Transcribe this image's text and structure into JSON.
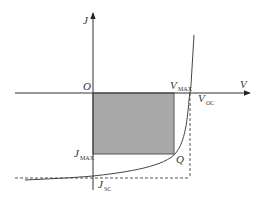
{
  "diagram": {
    "type": "solar-cell-iv-curve",
    "colors": {
      "axis": "#333333",
      "curve": "#444444",
      "rect_fill": "#a9a9a9",
      "rect_stroke": "#555555",
      "dashed": "#555555",
      "background": "#ffffff"
    },
    "axes": {
      "y_label": "J",
      "x_label": "V",
      "origin_label": "O"
    },
    "labels": {
      "vmax_main": "V",
      "vmax_sub": "MAX",
      "voc_main": "V",
      "voc_sub": "OC",
      "jmax_main": "J",
      "jmax_sub": "MAX",
      "jsc_main": "J",
      "jsc_sub": "SC",
      "q_point": "Q"
    }
  }
}
